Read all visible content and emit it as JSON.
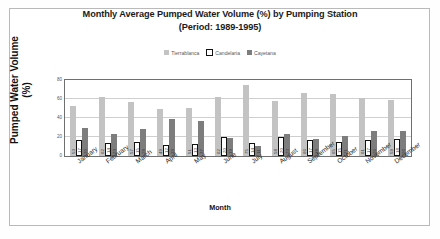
{
  "chart_data": {
    "type": "bar",
    "title": "Monthly Average Pumped Water Volume (%) by Pumping Station",
    "subtitle": "(Period: 1989-1995)",
    "xlabel": "Month",
    "ylabel": "Pumped Water Volume",
    "ylabel_unit": "(%)",
    "ylim": [
      0,
      80
    ],
    "yticks": [
      0,
      20,
      40,
      60,
      80
    ],
    "grid": true,
    "legend_position": "top",
    "categories": [
      "January",
      "February",
      "March",
      "April",
      "May",
      "June",
      "July",
      "August",
      "September",
      "October",
      "November",
      "December"
    ],
    "series": [
      {
        "name": "Tierrablanca",
        "color": "#c3c3c3",
        "values": [
          53,
          62,
          57,
          49,
          51,
          62,
          75,
          58,
          66,
          65,
          61,
          59
        ]
      },
      {
        "name": "Candelaria",
        "color": "#ffffff",
        "values": [
          17,
          14,
          15,
          12,
          13,
          20,
          14,
          20,
          17,
          15,
          17,
          18
        ]
      },
      {
        "name": "Cayetana",
        "color": "#7d7d7d",
        "values": [
          30,
          23,
          28,
          39,
          37,
          19,
          11,
          23,
          18,
          21,
          26,
          26
        ]
      }
    ]
  }
}
